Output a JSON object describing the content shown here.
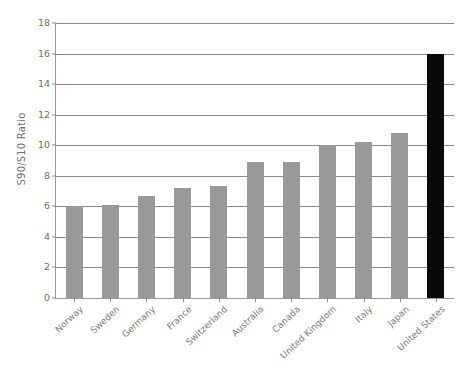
{
  "chart_data": {
    "type": "bar",
    "title": "",
    "subtitle": "",
    "xlabel": "",
    "ylabel": "S90/S10 Ratio",
    "categories": [
      "Norway",
      "Sweden",
      "Germany",
      "France",
      "Switzerland",
      "Australia",
      "Canada",
      "United Kingdom",
      "Italy",
      "Japan",
      "United States"
    ],
    "values": [
      6.0,
      6.1,
      6.7,
      7.2,
      7.35,
      8.9,
      8.9,
      10.0,
      10.2,
      10.8,
      16.0
    ],
    "ylim": [
      0,
      18
    ],
    "ytick_values": [
      0,
      2,
      4,
      6,
      8,
      10,
      12,
      14,
      16,
      18
    ],
    "ytick_labels": [
      "0",
      "2",
      "4",
      "6",
      "8",
      "10",
      "12",
      "14",
      "16",
      "18"
    ],
    "grid": true,
    "grid_axis": "y",
    "legend": false,
    "legend_position": "none",
    "bar_colors": [
      "#999999",
      "#999999",
      "#999999",
      "#999999",
      "#999999",
      "#999999",
      "#999999",
      "#999999",
      "#999999",
      "#999999",
      "#0a0a0a"
    ],
    "highlight_category": "United States",
    "highlight_color": "#0a0a0a",
    "default_bar_color": "#999999",
    "axis_color": "#8a8a8a",
    "text_color": "#6f6f6f",
    "background_color": "#ffffff",
    "xtick_rotation": -43
  }
}
